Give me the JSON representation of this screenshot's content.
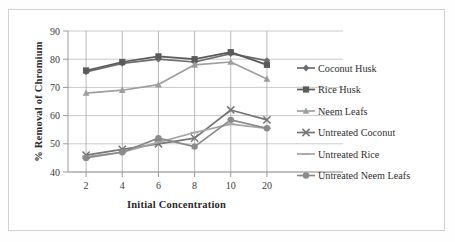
{
  "chart_data": {
    "type": "line",
    "title": "",
    "xlabel": "Initial Concentration",
    "ylabel": "% Removal of Chromium",
    "categories": [
      "2",
      "4",
      "6",
      "8",
      "10",
      "20"
    ],
    "ylim": [
      40,
      90
    ],
    "yticks": [
      "40",
      "50",
      "60",
      "70",
      "80",
      "90"
    ],
    "grid": true,
    "legend_position": "right",
    "series": [
      {
        "name": "Coconut Husk",
        "marker": "diamond",
        "color": "#6e6e6e",
        "values": [
          75.5,
          78.5,
          80.0,
          79.0,
          82.0,
          79.5
        ]
      },
      {
        "name": "Rice Husk",
        "marker": "square",
        "color": "#5a5a5a",
        "values": [
          76.0,
          79.0,
          81.0,
          80.0,
          82.5,
          78.0
        ]
      },
      {
        "name": "Neem Leafs",
        "marker": "triangle",
        "color": "#9e9e9e",
        "values": [
          68.0,
          69.0,
          71.0,
          78.0,
          79.0,
          73.0
        ]
      },
      {
        "name": "Untreated Coconut",
        "marker": "cross",
        "color": "#757575",
        "values": [
          46.0,
          48.0,
          50.0,
          52.0,
          62.0,
          58.5
        ]
      },
      {
        "name": "Untreated Rice",
        "marker": "dash",
        "color": "#a5a5a5",
        "values": [
          45.5,
          47.0,
          50.5,
          54.0,
          57.0,
          55.5
        ]
      },
      {
        "name": "Untreated Neem Leafs",
        "marker": "circle",
        "color": "#8a8a8a",
        "values": [
          45.0,
          47.0,
          52.0,
          49.0,
          58.5,
          55.5
        ]
      }
    ]
  },
  "legend": {
    "items": [
      {
        "label": "Coconut Husk"
      },
      {
        "label": "Rice Husk"
      },
      {
        "label": "Neem Leafs"
      },
      {
        "label": "Untreated Coconut"
      },
      {
        "label": "Untreated Rice"
      },
      {
        "label": "Untreated Neem Leafs"
      }
    ]
  }
}
